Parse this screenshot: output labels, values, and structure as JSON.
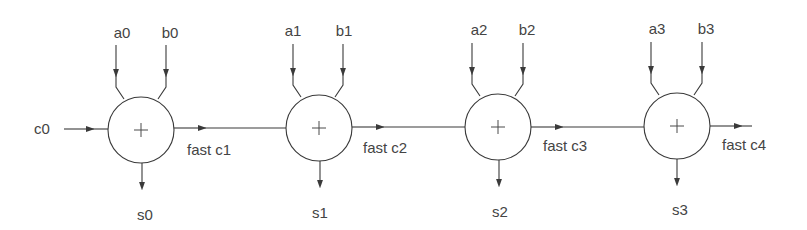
{
  "diagram": {
    "colors": {
      "line": "#3a3a3a",
      "text": "#444444",
      "background": "#ffffff"
    },
    "carry_in": {
      "label": "c0"
    },
    "operator_symbol": "+",
    "nodes": [
      {
        "id": "adder-0",
        "a": "a0",
        "b": "b0",
        "sum": "s0",
        "carry_out": "fast c1"
      },
      {
        "id": "adder-1",
        "a": "a1",
        "b": "b1",
        "sum": "s1",
        "carry_out": "fast c2"
      },
      {
        "id": "adder-2",
        "a": "a2",
        "b": "b2",
        "sum": "s2",
        "carry_out": "fast c3"
      },
      {
        "id": "adder-3",
        "a": "a3",
        "b": "b3",
        "sum": "s3",
        "carry_out": "fast c4"
      }
    ]
  }
}
